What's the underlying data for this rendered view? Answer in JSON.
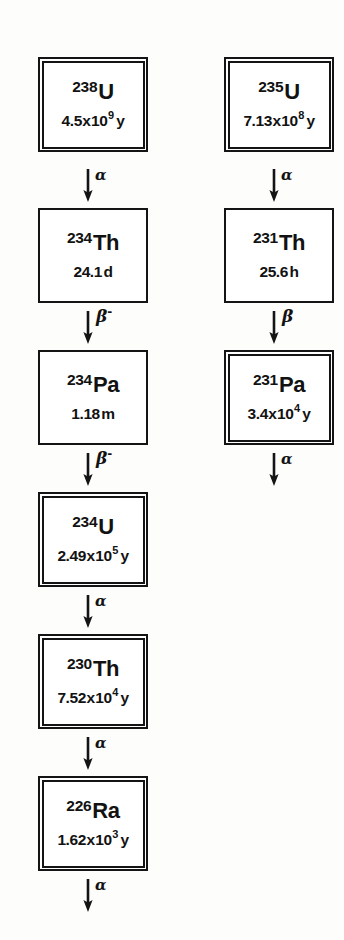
{
  "figure": {
    "ink_color": "#141414",
    "background_color": "#fdfdfc"
  },
  "chains": [
    {
      "id": "u238-series",
      "name": "Uranium-238 series",
      "column": "left",
      "nodes": [
        {
          "id": "u-238",
          "mass": "238",
          "symbol": "U",
          "halflife": {
            "mantissa": "4.5",
            "times": "x",
            "base": "10",
            "exponent": "9",
            "unit": "y"
          },
          "border": "double",
          "top": 57
        },
        {
          "id": "th-234",
          "mass": "234",
          "symbol": "Th",
          "halflife": {
            "mantissa": "24.1",
            "times": "",
            "base": "",
            "exponent": "",
            "unit": "d"
          },
          "border": "single",
          "top": 208
        },
        {
          "id": "pa-234",
          "mass": "234",
          "symbol": "Pa",
          "halflife": {
            "mantissa": "1.18",
            "times": "",
            "base": "",
            "exponent": "",
            "unit": "m"
          },
          "border": "single",
          "top": 350
        },
        {
          "id": "u-234",
          "mass": "234",
          "symbol": "U",
          "halflife": {
            "mantissa": "2.49",
            "times": "x",
            "base": "10",
            "exponent": "5",
            "unit": "y"
          },
          "border": "double",
          "top": 492
        },
        {
          "id": "th-230",
          "mass": "230",
          "symbol": "Th",
          "halflife": {
            "mantissa": "7.52",
            "times": "x",
            "base": "10",
            "exponent": "4",
            "unit": "y"
          },
          "border": "double",
          "top": 634
        },
        {
          "id": "ra-226",
          "mass": "226",
          "symbol": "Ra",
          "halflife": {
            "mantissa": "1.62",
            "times": "x",
            "base": "10",
            "exponent": "3",
            "unit": "y"
          },
          "border": "double",
          "top": 776
        }
      ],
      "arrows": [
        {
          "id": "u238-to-th234",
          "mode": "alpha",
          "label": "α",
          "superscript": "",
          "top": 164
        },
        {
          "id": "th234-to-pa234",
          "mode": "beta",
          "label": "β",
          "superscript": "-",
          "top": 306
        },
        {
          "id": "pa234-to-u234",
          "mode": "beta",
          "label": "β",
          "superscript": "-",
          "top": 448
        },
        {
          "id": "u234-to-th230",
          "mode": "alpha",
          "label": "α",
          "superscript": "",
          "top": 590
        },
        {
          "id": "th230-to-ra226",
          "mode": "alpha",
          "label": "α",
          "superscript": "",
          "top": 732
        },
        {
          "id": "ra226-to-next",
          "mode": "alpha",
          "label": "α",
          "superscript": "",
          "top": 874
        }
      ]
    },
    {
      "id": "u235-series",
      "name": "Uranium-235 series",
      "column": "right",
      "nodes": [
        {
          "id": "u-235",
          "mass": "235",
          "symbol": "U",
          "halflife": {
            "mantissa": "7.13",
            "times": "x",
            "base": "10",
            "exponent": "8",
            "unit": "y"
          },
          "border": "double",
          "top": 57
        },
        {
          "id": "th-231",
          "mass": "231",
          "symbol": "Th",
          "halflife": {
            "mantissa": "25.6",
            "times": "",
            "base": "",
            "exponent": "",
            "unit": "h"
          },
          "border": "single",
          "top": 208
        },
        {
          "id": "pa-231",
          "mass": "231",
          "symbol": "Pa",
          "halflife": {
            "mantissa": "3.4",
            "times": "x",
            "base": "10",
            "exponent": "4",
            "unit": "y"
          },
          "border": "double",
          "top": 350
        }
      ],
      "arrows": [
        {
          "id": "u235-to-th231",
          "mode": "alpha",
          "label": "α",
          "superscript": "",
          "top": 164
        },
        {
          "id": "th231-to-pa231",
          "mode": "beta",
          "label": "β",
          "superscript": "",
          "top": 306
        },
        {
          "id": "pa231-to-next",
          "mode": "alpha",
          "label": "α",
          "superscript": "",
          "top": 448
        }
      ]
    }
  ]
}
